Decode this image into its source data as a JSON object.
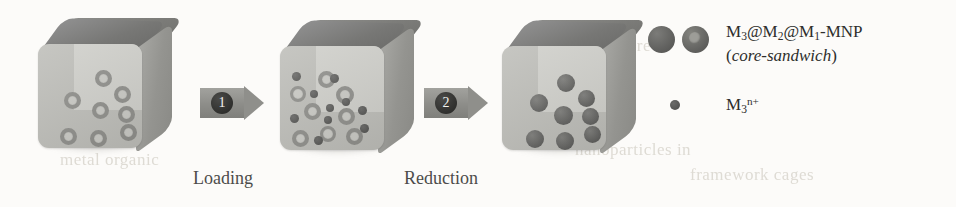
{
  "figure": {
    "type": "reaction-scheme"
  },
  "ghost_text": [
    {
      "text": "the structure of",
      "x": 560,
      "y": 36
    },
    {
      "text": "nanoparticles in",
      "x": 575,
      "y": 140
    },
    {
      "text": "metal organic",
      "x": 60,
      "y": 150
    },
    {
      "text": "framework cages",
      "x": 690,
      "y": 165
    }
  ],
  "cubes": [
    {
      "name": "cube-mof-empty",
      "x": 30,
      "y": 14,
      "particles": [
        {
          "kind": "ring",
          "x": 26,
          "y": 48,
          "d": 17
        },
        {
          "kind": "ring",
          "x": 54,
          "y": 58,
          "d": 17
        },
        {
          "kind": "ring",
          "x": 57,
          "y": 26,
          "d": 17
        },
        {
          "kind": "ring",
          "x": 76,
          "y": 42,
          "d": 17
        },
        {
          "kind": "ring",
          "x": 80,
          "y": 62,
          "d": 17
        },
        {
          "kind": "ring",
          "x": 82,
          "y": 80,
          "d": 17
        },
        {
          "kind": "ring",
          "x": 22,
          "y": 84,
          "d": 17
        },
        {
          "kind": "ring",
          "x": 52,
          "y": 86,
          "d": 17
        }
      ]
    },
    {
      "name": "cube-mof-loaded",
      "x": 272,
      "y": 16,
      "particles": [
        {
          "kind": "ring",
          "x": 10,
          "y": 40,
          "d": 16
        },
        {
          "kind": "ring",
          "x": 38,
          "y": 25,
          "d": 17
        },
        {
          "kind": "ring",
          "x": 24,
          "y": 57,
          "d": 17
        },
        {
          "kind": "ring",
          "x": 56,
          "y": 40,
          "d": 18
        },
        {
          "kind": "ring",
          "x": 58,
          "y": 62,
          "d": 17
        },
        {
          "kind": "ring",
          "x": 12,
          "y": 84,
          "d": 17
        },
        {
          "kind": "ring",
          "x": 40,
          "y": 80,
          "d": 16
        },
        {
          "kind": "ring",
          "x": 66,
          "y": 82,
          "d": 17
        },
        {
          "kind": "dot",
          "x": 12,
          "y": 26,
          "d": 9
        },
        {
          "kind": "dot",
          "x": 30,
          "y": 44,
          "d": 8
        },
        {
          "kind": "dot",
          "x": 50,
          "y": 28,
          "d": 9
        },
        {
          "kind": "dot",
          "x": 62,
          "y": 52,
          "d": 8
        },
        {
          "kind": "dot",
          "x": 46,
          "y": 58,
          "d": 8
        },
        {
          "kind": "dot",
          "x": 78,
          "y": 60,
          "d": 9
        },
        {
          "kind": "dot",
          "x": 10,
          "y": 68,
          "d": 9
        },
        {
          "kind": "dot",
          "x": 80,
          "y": 78,
          "d": 9
        },
        {
          "kind": "dot",
          "x": 34,
          "y": 90,
          "d": 9
        },
        {
          "kind": "dot",
          "x": 44,
          "y": 70,
          "d": 8
        }
      ]
    },
    {
      "name": "cube-nanoparticles",
      "x": 494,
      "y": 16,
      "particles": [
        {
          "kind": "solid",
          "x": 28,
          "y": 48,
          "d": 18
        },
        {
          "kind": "solid",
          "x": 55,
          "y": 28,
          "d": 18
        },
        {
          "kind": "solid",
          "x": 52,
          "y": 60,
          "d": 19
        },
        {
          "kind": "solid",
          "x": 76,
          "y": 44,
          "d": 17
        },
        {
          "kind": "solid",
          "x": 80,
          "y": 62,
          "d": 17
        },
        {
          "kind": "solid",
          "x": 82,
          "y": 80,
          "d": 17
        },
        {
          "kind": "solid",
          "x": 24,
          "y": 84,
          "d": 18
        },
        {
          "kind": "solid",
          "x": 54,
          "y": 86,
          "d": 18
        }
      ]
    }
  ],
  "arrows": [
    {
      "name": "arrow-step-1",
      "label": "1",
      "x": 200,
      "y": 88,
      "caption": "Loading",
      "caption_x": 193,
      "caption_y": 168
    },
    {
      "name": "arrow-step-2",
      "label": "2",
      "x": 424,
      "y": 88,
      "caption": "Reduction",
      "caption_x": 404,
      "caption_y": 168
    }
  ],
  "legend": {
    "rows": [
      {
        "name": "legend-core-sandwich",
        "markers": [
          "solid-circle",
          "ring-circle"
        ],
        "line1_html": "M<sub>3</sub>@M<sub>2</sub>@M<sub>1</sub>-MNP",
        "line2_html": "(<span class=\"it\">core-sandwich</span>)"
      },
      {
        "name": "legend-metal-ion",
        "markers": [
          "small-dot"
        ],
        "line1_html": "M<sub>3</sub><sup>n+</sup>",
        "line2_html": ""
      }
    ]
  },
  "colors": {
    "cube_top": "#777774",
    "cube_side": "#949490",
    "cube_front": "#bdbdb8",
    "cube_front_inner": "#cfcfca",
    "particle_ring_stroke": "#8e8e8a",
    "particle_solid": "#5f5f5d",
    "arrow_body": "#8d8d89",
    "badge": "#2e2e2c",
    "text": "#2e2e2c",
    "caption": "#4c4c4a",
    "background": "#fcfbf9"
  }
}
